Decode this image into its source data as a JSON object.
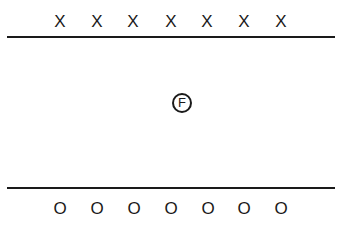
{
  "diagram": {
    "top_row": {
      "symbol": "X",
      "count": 7,
      "marks": [
        "X",
        "X",
        "X",
        "X",
        "X",
        "X",
        "X"
      ]
    },
    "center_player": {
      "label": "F",
      "shape": "circle"
    },
    "bottom_row": {
      "symbol": "O",
      "count": 7,
      "marks": [
        "O",
        "O",
        "O",
        "O",
        "O",
        "O",
        "O"
      ]
    },
    "lines": [
      "top-line",
      "bottom-line"
    ]
  }
}
